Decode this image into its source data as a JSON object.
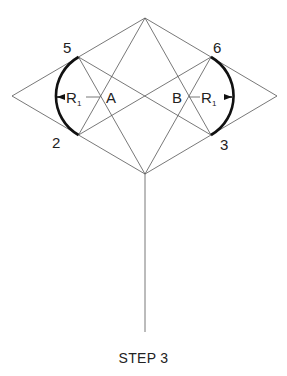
{
  "diagram": {
    "caption": "STEP 3",
    "points": {
      "p5": "5",
      "p6": "6",
      "p2": "2",
      "p3": "3",
      "a": "A",
      "b": "B"
    },
    "radius_label_left": "R",
    "radius_sub_left": "1",
    "radius_label_right": "R",
    "radius_sub_right": "1",
    "colors": {
      "line": "#555555",
      "arc": "#111111",
      "text": "#222222",
      "background": "#ffffff"
    }
  }
}
